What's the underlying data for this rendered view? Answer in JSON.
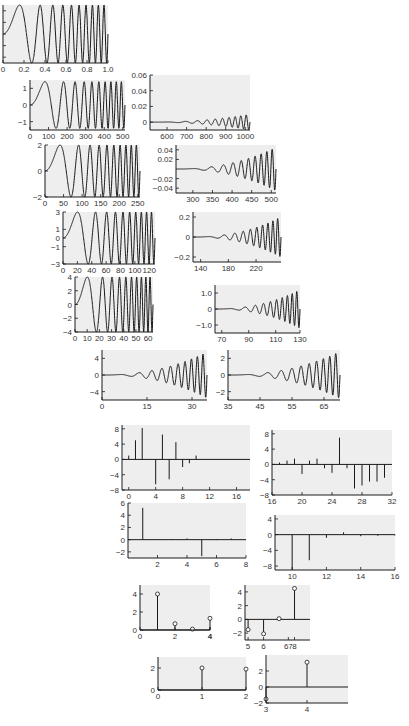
{
  "figure": {
    "background": "#ffffff",
    "plot_bg": "#eeeeee",
    "line_color": "#1a1a1a"
  },
  "chart_data": [
    {
      "id": "p1",
      "type": "line",
      "title": "",
      "xlabel": "",
      "ylabel": "",
      "desc": "chirp signal, amplitude 1",
      "xlim": [
        0,
        1.0
      ],
      "ylim": [
        -1,
        1
      ],
      "xticks": [
        "0",
        "0.2",
        "0.4",
        "0.6",
        "0.8",
        "1.0"
      ],
      "yticks": [
        "0.8",
        "0.4",
        "0",
        "-0.4",
        "-0.8"
      ],
      "grid": false,
      "amp": 1,
      "cycles": 10,
      "pos": {
        "x": 3,
        "y": 5,
        "w": 105,
        "h": 58
      }
    },
    {
      "id": "p2",
      "type": "line",
      "desc": "approximation level 1, amplitude ~1.4",
      "xlim": [
        0,
        512
      ],
      "ylim": [
        -1.5,
        1.5
      ],
      "xticks": [
        "0",
        "100",
        "200",
        "300",
        "400",
        "500"
      ],
      "yticks": [
        "1",
        "0",
        "-1"
      ],
      "amp": 1.4,
      "cycles": 10,
      "pos": {
        "x": 30,
        "y": 80,
        "w": 95,
        "h": 50
      }
    },
    {
      "id": "p3",
      "type": "line",
      "desc": "detail level 1, amplitude grows to ~0.01",
      "xlim": [
        513,
        1024
      ],
      "ylim": [
        -0.01,
        0.06
      ],
      "xticks": [
        "600",
        "700",
        "800",
        "900",
        "1000"
      ],
      "yticks": [
        "0.06",
        "0.04",
        "0.02",
        "0"
      ],
      "amp": 0.01,
      "pos": {
        "x": 150,
        "y": 75,
        "w": 100,
        "h": 55
      }
    },
    {
      "id": "p4",
      "type": "line",
      "desc": "approximation level 2, amplitude 2",
      "xlim": [
        0,
        256
      ],
      "ylim": [
        -2,
        2
      ],
      "xticks": [
        "0",
        "50",
        "100",
        "150",
        "200",
        "250"
      ],
      "yticks": [
        "2",
        "0",
        "-2"
      ],
      "amp": 2,
      "cycles": 10,
      "pos": {
        "x": 45,
        "y": 145,
        "w": 95,
        "h": 52
      }
    },
    {
      "id": "p5",
      "type": "line",
      "desc": "detail level 2, amplitude grows to ~0.045",
      "xlim": [
        257,
        512
      ],
      "ylim": [
        -0.05,
        0.05
      ],
      "xticks": [
        "300",
        "350",
        "400",
        "450",
        "500"
      ],
      "yticks": [
        "0.04",
        "0.02",
        "-0.02",
        "-0.04"
      ],
      "amp": 0.045,
      "pos": {
        "x": 176,
        "y": 145,
        "w": 100,
        "h": 48
      }
    },
    {
      "id": "p6",
      "type": "line",
      "desc": "approximation level 3, amplitude 3",
      "xlim": [
        0,
        128
      ],
      "ylim": [
        -3,
        3
      ],
      "xticks": [
        "0",
        "20",
        "40",
        "60",
        "80",
        "100",
        "120"
      ],
      "yticks": [
        "3",
        "1",
        "0",
        "-1",
        "-3"
      ],
      "amp": 3,
      "cycles": 10,
      "pos": {
        "x": 63,
        "y": 212,
        "w": 92,
        "h": 52
      }
    },
    {
      "id": "p7",
      "type": "line",
      "desc": "detail level 3, amplitude grows to ~0.2",
      "xlim": [
        129,
        256
      ],
      "ylim": [
        -0.25,
        0.25
      ],
      "xticks": [
        "140",
        "180",
        "220"
      ],
      "yticks": [
        "0.2",
        "0",
        "-0.2"
      ],
      "amp": 0.2,
      "pos": {
        "x": 193,
        "y": 212,
        "w": 88,
        "h": 50
      }
    },
    {
      "id": "p8",
      "type": "line",
      "desc": "approximation level 4, amplitude 4",
      "xlim": [
        0,
        64
      ],
      "ylim": [
        -4,
        4
      ],
      "xticks": [
        "0",
        "10",
        "20",
        "30",
        "40",
        "50",
        "60"
      ],
      "yticks": [
        "4",
        "2",
        "0",
        "-2",
        "-4"
      ],
      "amp": 4,
      "cycles": 10,
      "pos": {
        "x": 75,
        "y": 277,
        "w": 78,
        "h": 55
      }
    },
    {
      "id": "p9",
      "type": "line",
      "desc": "detail level 4, amplitude grows to ~1.2",
      "xlim": [
        65,
        128
      ],
      "ylim": [
        -1.5,
        1.5
      ],
      "xticks": [
        "70",
        "90",
        "110",
        "130"
      ],
      "yticks": [
        "1.0",
        "0",
        "-1.0"
      ],
      "amp": 1.2,
      "pos": {
        "x": 215,
        "y": 285,
        "w": 85,
        "h": 48
      }
    },
    {
      "id": "p10",
      "type": "line",
      "desc": "approximation level 5, amplitude ~5.5",
      "xlim": [
        0,
        35
      ],
      "ylim": [
        -6,
        6
      ],
      "xticks": [
        "0",
        "15",
        "30"
      ],
      "yticks": [
        "4",
        "0",
        "-4"
      ],
      "amp": 5.5,
      "pos": {
        "x": 102,
        "y": 350,
        "w": 105,
        "h": 50
      }
    },
    {
      "id": "p11",
      "type": "line",
      "desc": "detail level 5",
      "xlim": [
        35,
        70
      ],
      "ylim": [
        -3,
        3
      ],
      "xticks": [
        "35",
        "45",
        "55",
        "65"
      ],
      "yticks": [
        "2",
        "0",
        "-2"
      ],
      "amp": 2.8,
      "pos": {
        "x": 228,
        "y": 350,
        "w": 112,
        "h": 50
      }
    },
    {
      "id": "p12",
      "type": "stem",
      "desc": "approximation level 6",
      "xlim": [
        -1,
        18
      ],
      "ylim": [
        -8,
        9
      ],
      "xticks": [
        "0",
        "4",
        "8",
        "12",
        "16"
      ],
      "yticks": [
        "8",
        "4",
        "0",
        "-4",
        "-8"
      ],
      "x": [
        0,
        1,
        2,
        3,
        4,
        5,
        6,
        7,
        8,
        9,
        10,
        11,
        12
      ],
      "values": [
        1,
        5,
        8.2,
        0,
        -6.5,
        6.5,
        -5.2,
        4.5,
        -2,
        -1,
        1,
        0,
        0
      ],
      "pos": {
        "x": 122,
        "y": 425,
        "w": 128,
        "h": 65
      }
    },
    {
      "id": "p13",
      "type": "stem",
      "desc": "detail level 6",
      "xlim": [
        16,
        32
      ],
      "ylim": [
        -8,
        9
      ],
      "xticks": [
        "16",
        "20",
        "24",
        "28",
        "32"
      ],
      "yticks": [
        "8",
        "4",
        "0",
        "-4",
        "-8"
      ],
      "x": [
        17,
        18,
        19,
        20,
        21,
        22,
        23,
        24,
        25,
        26,
        27,
        28,
        29,
        30,
        31
      ],
      "values": [
        0.5,
        1,
        1.5,
        -2.5,
        1,
        1.5,
        -1,
        -2.2,
        7,
        -1,
        -6.3,
        -5.5,
        -4.5,
        -4.5,
        -3.5
      ],
      "pos": {
        "x": 272,
        "y": 430,
        "w": 120,
        "h": 65
      }
    },
    {
      "id": "p14",
      "type": "stem",
      "desc": "approximation level 7",
      "xlim": [
        0,
        8
      ],
      "ylim": [
        -3,
        6
      ],
      "xticks": [
        "2",
        "4",
        "6",
        "8"
      ],
      "yticks": [
        "6",
        "4",
        "2",
        "0",
        "-2"
      ],
      "x": [
        1,
        2,
        3,
        4,
        5,
        6,
        7
      ],
      "values": [
        5.2,
        0.1,
        0.1,
        0.2,
        -2.7,
        0.1,
        0.2
      ],
      "pos": {
        "x": 128,
        "y": 503,
        "w": 118,
        "h": 55
      }
    },
    {
      "id": "p15",
      "type": "stem",
      "desc": "detail level 7",
      "xlim": [
        9,
        16
      ],
      "ylim": [
        -9,
        5
      ],
      "xticks": [
        "10",
        "12",
        "14",
        "16"
      ],
      "yticks": [
        "4",
        "0",
        "-4",
        "-8"
      ],
      "x": [
        10,
        11,
        12,
        13,
        14,
        15,
        16
      ],
      "values": [
        -9,
        -6.5,
        -0.8,
        0.6,
        -0.4,
        -0.3,
        -0.2
      ],
      "pos": {
        "x": 275,
        "y": 515,
        "w": 120,
        "h": 55
      }
    },
    {
      "id": "p16",
      "type": "stem",
      "marker": "circle",
      "desc": "approximation level 8",
      "xlim": [
        0,
        4
      ],
      "ylim": [
        0,
        5
      ],
      "xticks": [
        "0",
        "2",
        "4",
        "4"
      ],
      "yticks": [
        "4",
        "2",
        "0"
      ],
      "x": [
        1,
        2,
        3,
        4
      ],
      "values": [
        4,
        0.7,
        0.1,
        1.3
      ],
      "pos": {
        "x": 140,
        "y": 585,
        "w": 70,
        "h": 45
      }
    },
    {
      "id": "p17",
      "type": "stem",
      "marker": "circle",
      "desc": "detail level 8",
      "xlim": [
        4.8,
        9
      ],
      "ylim": [
        -3,
        5
      ],
      "xticks": [
        "5",
        "6",
        "67",
        "8"
      ],
      "yticks": [
        "4",
        "2",
        "0",
        "-2"
      ],
      "x": [
        5,
        6,
        7,
        8
      ],
      "values": [
        -1.5,
        -2.1,
        0.1,
        4.5
      ],
      "pos": {
        "x": 245,
        "y": 585,
        "w": 65,
        "h": 55
      }
    },
    {
      "id": "p18",
      "type": "stem",
      "marker": "circle",
      "desc": "approximation level 9",
      "xlim": [
        0,
        2
      ],
      "ylim": [
        0,
        3
      ],
      "xticks": [
        "0",
        "1",
        "2"
      ],
      "yticks": [
        "2",
        "0"
      ],
      "x": [
        1,
        2
      ],
      "values": [
        2,
        1.9
      ],
      "pos": {
        "x": 158,
        "y": 657,
        "w": 88,
        "h": 33
      }
    },
    {
      "id": "p19",
      "type": "stem",
      "marker": "circle",
      "desc": "detail level 9",
      "xlim": [
        3,
        5
      ],
      "ylim": [
        -2,
        4
      ],
      "xticks": [
        "3",
        "4"
      ],
      "yticks": [
        "2",
        "0",
        "-2"
      ],
      "x": [
        3,
        4
      ],
      "values": [
        -1.5,
        3.1
      ],
      "pos": {
        "x": 266,
        "y": 655,
        "w": 82,
        "h": 48
      }
    }
  ]
}
